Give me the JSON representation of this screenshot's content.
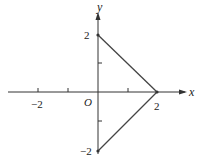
{
  "figure": {
    "type": "coordinate-plot",
    "axes": {
      "x_label": "x",
      "y_label": "y",
      "origin_label": "O",
      "x_ticks": [
        -2,
        -1,
        1,
        2
      ],
      "y_ticks": [
        -2,
        -1,
        1,
        2
      ],
      "x_tick_labels": [
        "−2",
        "2"
      ],
      "y_tick_labels": [
        "2",
        "−2"
      ]
    },
    "shape": {
      "description": "Two line segments forming a triangle-like shape with the y-axis",
      "vertices": [
        [
          0,
          2
        ],
        [
          2,
          0
        ],
        [
          0,
          -2
        ]
      ],
      "segments": [
        {
          "from": [
            0,
            2
          ],
          "to": [
            2,
            0
          ]
        },
        {
          "from": [
            2,
            0
          ],
          "to": [
            0,
            -2
          ]
        }
      ]
    },
    "colors": {
      "line": "#333333",
      "background": "#ffffff"
    }
  },
  "labels": {
    "x_axis": "x",
    "y_axis": "y",
    "origin": "O",
    "x_neg2": "−2",
    "x_pos2": "2",
    "y_pos2": "2",
    "y_neg2": "−2"
  }
}
